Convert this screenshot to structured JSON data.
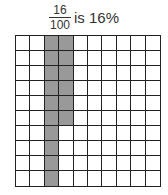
{
  "caption": {
    "numerator": "16",
    "denominator": "100",
    "text": "is 16%"
  },
  "grid": {
    "rows": 10,
    "cols": 10,
    "shaded_color": "#999999",
    "shaded_cells_description": "column 3 all 10 rows, column 4 rows 1-6",
    "shaded": [
      [
        0,
        2
      ],
      [
        1,
        2
      ],
      [
        2,
        2
      ],
      [
        3,
        2
      ],
      [
        4,
        2
      ],
      [
        5,
        2
      ],
      [
        6,
        2
      ],
      [
        7,
        2
      ],
      [
        8,
        2
      ],
      [
        9,
        2
      ],
      [
        0,
        3
      ],
      [
        1,
        3
      ],
      [
        2,
        3
      ],
      [
        3,
        3
      ],
      [
        4,
        3
      ],
      [
        5,
        3
      ]
    ],
    "shaded_count": 16
  }
}
